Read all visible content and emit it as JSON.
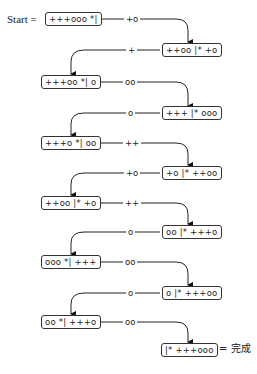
{
  "start_label": "Start =",
  "done_label": "= 完成",
  "states": [
    {
      "text": "+++ooo *|",
      "side": "start"
    },
    {
      "text": "++oo |* +o",
      "side": "right"
    },
    {
      "text": "+++oo *| o",
      "side": "left"
    },
    {
      "text": "+++ |* ooo",
      "side": "right"
    },
    {
      "text": "+++o *| oo",
      "side": "left"
    },
    {
      "text": "+o |* ++oo",
      "side": "right"
    },
    {
      "text": "++oo |* +o",
      "side": "left"
    },
    {
      "text": "oo |* +++o",
      "side": "right"
    },
    {
      "text": "ooo *| +++",
      "side": "left"
    },
    {
      "text": "o |* +++oo",
      "side": "right"
    },
    {
      "text": "oo *| +++o",
      "side": "left"
    },
    {
      "text": "|* +++ooo",
      "side": "right"
    }
  ],
  "moves": [
    "+o",
    "+",
    "oo",
    "o",
    "++",
    "+o",
    "++",
    "o",
    "oo",
    "o",
    "oo"
  ]
}
